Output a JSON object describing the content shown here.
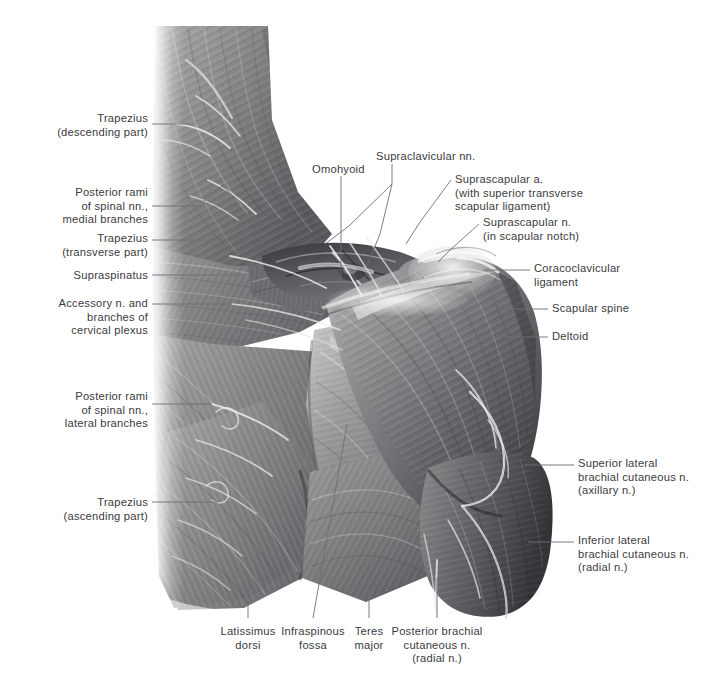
{
  "figure": {
    "kind": "anatomical-illustration",
    "background_color": "#ffffff",
    "label_text_color": "#3b3b3e",
    "leader_line_color": "#6e6e73"
  },
  "labels": {
    "left": [
      {
        "name": "trapezius-descending",
        "lines": [
          "Trapezius",
          "(descending part)"
        ],
        "x_right": 148,
        "y_top": 112
      },
      {
        "name": "posterior-rami-medial",
        "lines": [
          "Posterior rami",
          "of spinal nn.,",
          "medial branches"
        ],
        "x_right": 148,
        "y_top": 186
      },
      {
        "name": "trapezius-transverse",
        "lines": [
          "Trapezius",
          "(transverse part)"
        ],
        "x_right": 148,
        "y_top": 232
      },
      {
        "name": "supraspinatus",
        "lines": [
          "Supraspinatus"
        ],
        "x_right": 148,
        "y_top": 269
      },
      {
        "name": "accessory-nerve-cervical-plexus",
        "lines": [
          "Accessory n. and",
          "branches of",
          "cervical plexus"
        ],
        "x_right": 148,
        "y_top": 297
      },
      {
        "name": "posterior-rami-lateral",
        "lines": [
          "Posterior rami",
          "of spinal nn.,",
          "lateral branches"
        ],
        "x_right": 148,
        "y_top": 390
      },
      {
        "name": "trapezius-ascending",
        "lines": [
          "Trapezius",
          "(ascending part)"
        ],
        "x_right": 148,
        "y_top": 496
      }
    ],
    "top": [
      {
        "name": "omohyoid",
        "lines": [
          "Omohyoid"
        ],
        "x_left": 312,
        "y_top": 163
      },
      {
        "name": "supraclavicular-nn",
        "lines": [
          "Supraclavicular nn."
        ],
        "x_left": 376,
        "y_top": 150
      }
    ],
    "right": [
      {
        "name": "suprascapular-artery",
        "lines": [
          "Suprascapular a.",
          "(with superior transverse",
          "scapular ligament)"
        ],
        "x_left": 455,
        "y_top": 173
      },
      {
        "name": "suprascapular-nerve",
        "lines": [
          "Suprascapular n.",
          "(in scapular notch)"
        ],
        "x_left": 483,
        "y_top": 216
      },
      {
        "name": "coracoclavicular-ligament",
        "lines": [
          "Coracoclavicular",
          "ligament"
        ],
        "x_left": 534,
        "y_top": 262
      },
      {
        "name": "scapular-spine",
        "lines": [
          "Scapular spine"
        ],
        "x_left": 552,
        "y_top": 302
      },
      {
        "name": "deltoid",
        "lines": [
          "Deltoid"
        ],
        "x_left": 552,
        "y_top": 330
      },
      {
        "name": "superior-lateral-brachial-cutaneous-nerve",
        "lines": [
          "Superior lateral",
          "brachial cutaneous n.",
          "(axillary n.)"
        ],
        "x_left": 578,
        "y_top": 457
      },
      {
        "name": "inferior-lateral-brachial-cutaneous-nerve",
        "lines": [
          "Inferior lateral",
          "brachial cutaneous n.",
          "(radial n.)"
        ],
        "x_left": 578,
        "y_top": 534
      }
    ],
    "bottom": [
      {
        "name": "latissimus-dorsi",
        "lines": [
          "Latissimus",
          "dorsi"
        ],
        "x_center": 248,
        "y_top": 625
      },
      {
        "name": "infraspinous-fossa",
        "lines": [
          "Infraspinous",
          "fossa"
        ],
        "x_center": 313,
        "y_top": 625
      },
      {
        "name": "teres-major",
        "lines": [
          "Teres",
          "major"
        ],
        "x_center": 369,
        "y_top": 625
      },
      {
        "name": "posterior-brachial-cutaneous-nerve",
        "lines": [
          "Posterior brachial",
          "cutaneous n.",
          "(radial n.)"
        ],
        "x_center": 437,
        "y_top": 625
      }
    ]
  },
  "leader_lines": [
    {
      "name": "leader-trapezius-descending",
      "points": "152,124 190,124"
    },
    {
      "name": "leader-posterior-rami-medial",
      "points": "152,206 198,206 222,186 238,200"
    },
    {
      "name": "leader-trapezius-transverse",
      "points": "152,240 232,240"
    },
    {
      "name": "leader-supraspinatus",
      "points": "152,275 243,275"
    },
    {
      "name": "leader-accessory-nerve",
      "points": "152,304 232,304"
    },
    {
      "name": "leader-posterior-rami-lateral",
      "points": "152,404 212,404"
    },
    {
      "name": "leader-trapezius-ascending",
      "points": "152,502 218,502"
    },
    {
      "name": "leader-omohyoid",
      "points": "341,176 341,285"
    },
    {
      "name": "leader-supraclavicular-nn",
      "points": "392,164 392,184 349,226 325,244"
    },
    {
      "name": "leader-supraclavicular-nn-b",
      "points": "392,184 380,234 366,268"
    },
    {
      "name": "leader-suprascapular-artery",
      "points": "451,180 420,222 406,244"
    },
    {
      "name": "leader-suprascapular-nerve",
      "points": "479,224 450,250 438,262"
    },
    {
      "name": "leader-coracoclavicular-ligament",
      "points": "484,270 530,270"
    },
    {
      "name": "leader-scapular-spine",
      "points": "498,309 548,309"
    },
    {
      "name": "leader-deltoid",
      "points": "500,337 548,337"
    },
    {
      "name": "leader-superior-lateral-brachial",
      "points": "525,465 574,465"
    },
    {
      "name": "leader-inferior-lateral-brachial",
      "points": "528,542 574,542"
    },
    {
      "name": "leader-latissimus-dorsi",
      "points": "248,586 248,618"
    },
    {
      "name": "leader-infraspinous-fossa",
      "points": "347,424 313,618"
    },
    {
      "name": "leader-teres-major",
      "points": "369,580 369,618"
    },
    {
      "name": "leader-posterior-brachial",
      "points": "437,578 437,618"
    }
  ]
}
